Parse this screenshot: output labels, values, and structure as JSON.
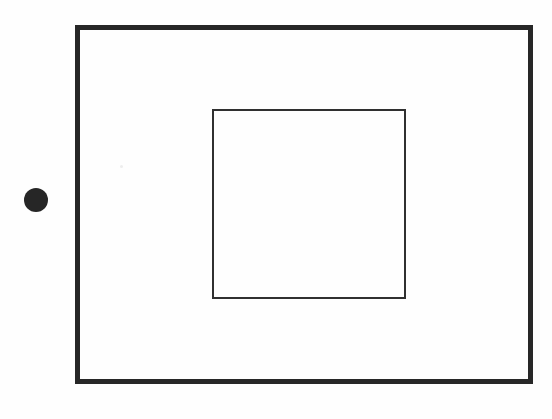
{
  "figure": {
    "canvas": {
      "width": 552,
      "height": 419,
      "background_color": "#ffffff",
      "paper_color": "#fefefe"
    },
    "shapes": {
      "outer_rectangle": {
        "label": "outer rectangle",
        "x": 75,
        "y": 25,
        "width": 458,
        "height": 359,
        "stroke_width": 5,
        "stroke_color": "#272727",
        "fill": "none"
      },
      "inner_rectangle": {
        "label": "inner rectangle",
        "x": 212,
        "y": 109,
        "width": 194,
        "height": 190,
        "stroke_width": 2,
        "stroke_color": "#303030",
        "fill": "none"
      },
      "dot_marker": {
        "label": "filled dot",
        "center_x": 36,
        "center_y": 200,
        "diameter": 24,
        "fill_color": "#262626"
      }
    },
    "artifacts": [
      {
        "label": "scan speck",
        "x": 120,
        "y": 165,
        "size": 3,
        "color": "#ededed"
      }
    ]
  }
}
